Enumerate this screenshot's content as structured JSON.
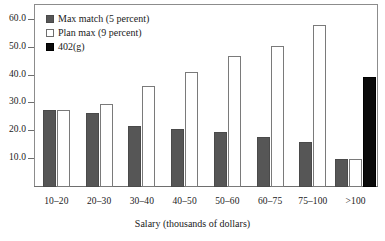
{
  "chart_data": {
    "type": "bar",
    "title": "",
    "subtitle": "",
    "xlabel": "Salary (thousands of dollars)",
    "ylabel": "",
    "categories": [
      "10–20",
      "20–30",
      "30–40",
      "40–50",
      "50–60",
      "60–75",
      "75–100",
      ">100"
    ],
    "series": [
      {
        "name": "Max match (5 percent)",
        "color": "#565656",
        "values": [
          27.7,
          26.5,
          22.0,
          20.9,
          19.6,
          17.9,
          16.1,
          10.0
        ]
      },
      {
        "name": "Plan max (9 percent)",
        "color": "#ffffff",
        "values": [
          27.7,
          29.8,
          36.4,
          41.2,
          47.0,
          50.8,
          58.1,
          10.0
        ]
      },
      {
        "name": "402(g)",
        "color": "#0a0a0a",
        "values": [
          null,
          null,
          null,
          null,
          null,
          null,
          null,
          39.4
        ]
      }
    ],
    "ylim": [
      0,
      65
    ],
    "yticks": [
      10.0,
      20.0,
      30.0,
      40.0,
      50.0,
      60.0
    ],
    "ytick_labels": [
      "10.0",
      "20.0",
      "30.0",
      "40.0",
      "50.0",
      "60.0"
    ],
    "grid": false,
    "legend_position": "top-left",
    "frame": true
  },
  "legend": {
    "items": [
      {
        "label": "Max match (5 percent)",
        "swatch": "gray-filled-square-icon"
      },
      {
        "label": "Plan max (9 percent)",
        "swatch": "white-open-square-icon"
      },
      {
        "label": "402(g)",
        "swatch": "black-filled-square-icon"
      }
    ]
  },
  "axes": {
    "x_title": "Salary (thousands of dollars)",
    "y_tick_labels": [
      "60.0",
      "50.0",
      "40.0",
      "30.0",
      "20.0",
      "10.0"
    ],
    "x_tick_labels": [
      "10–20",
      "20–30",
      "30–40",
      "40–50",
      "50–60",
      "60–75",
      "75–100",
      ">100"
    ]
  }
}
